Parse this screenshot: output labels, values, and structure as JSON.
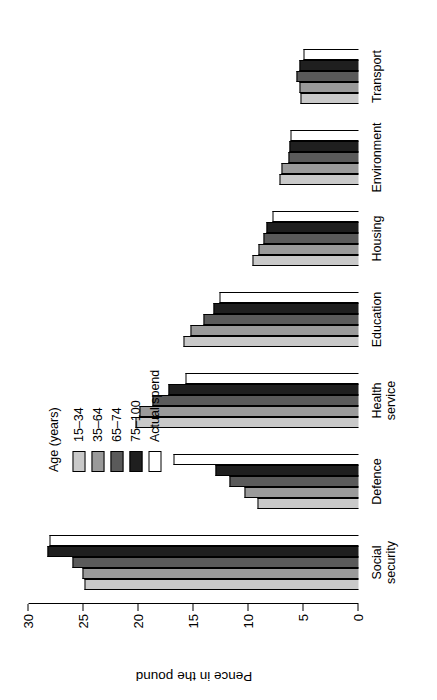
{
  "figure": {
    "orientation": "rotated-90-ccw",
    "background": "#ffffff"
  },
  "axis": {
    "title": "Pence in the pound",
    "ticks": [
      "0",
      "5",
      "10",
      "15",
      "20",
      "25",
      "30"
    ]
  },
  "legend": {
    "title": "Age (years)",
    "entries": [
      {
        "label": "15–34",
        "color": "#c9c9c9"
      },
      {
        "label": "35–64",
        "color": "#9a9a9a"
      },
      {
        "label": "65–74",
        "color": "#5a5a5a"
      },
      {
        "label": "75–100",
        "color": "#1f1f1f"
      },
      {
        "label": "Actual spend",
        "color": "#ffffff"
      }
    ]
  },
  "chart_data": {
    "type": "bar",
    "title": "",
    "xlabel": "",
    "ylabel": "Pence in the pound",
    "ylim": [
      0,
      30
    ],
    "yticks": [
      0,
      5,
      10,
      15,
      20,
      25,
      30
    ],
    "grid": false,
    "legend_position": "upper-right",
    "categories": [
      "Social\nsecurity",
      "Defence",
      "Health\nservice",
      "Education",
      "Housing",
      "Environment",
      "Transport"
    ],
    "series": [
      {
        "name": "15–34",
        "color": "#c9c9c9",
        "values": [
          24.9,
          9.2,
          20.3,
          15.9,
          9.6,
          7.2,
          5.3
        ]
      },
      {
        "name": "35–64",
        "color": "#9a9a9a",
        "values": [
          25.1,
          10.4,
          19.9,
          15.3,
          9.1,
          7.0,
          5.4
        ]
      },
      {
        "name": "65–74",
        "color": "#5a5a5a",
        "values": [
          26.0,
          11.7,
          18.7,
          14.1,
          8.6,
          6.4,
          5.6
        ]
      },
      {
        "name": "75–100",
        "color": "#1f1f1f",
        "values": [
          28.3,
          13.0,
          17.3,
          13.2,
          8.4,
          6.3,
          5.4
        ]
      },
      {
        "name": "Actual spend",
        "color": "#ffffff",
        "values": [
          28.1,
          16.8,
          15.7,
          12.6,
          7.8,
          6.2,
          5.0
        ]
      }
    ]
  }
}
